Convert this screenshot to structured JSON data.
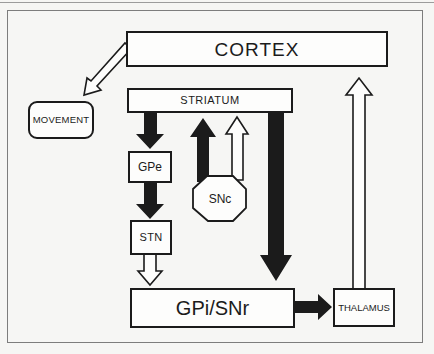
{
  "diagram": {
    "nodes": {
      "cortex": {
        "label": "CORTEX"
      },
      "movement": {
        "label": "MOVEMENT"
      },
      "striatum": {
        "label": "STRIATUM"
      },
      "gpe": {
        "label": "GPe"
      },
      "snc": {
        "label": "SNc"
      },
      "stn": {
        "label": "STN"
      },
      "gpi_snr": {
        "label": "GPi/SNr"
      },
      "thalamus": {
        "label": "THALAMUS"
      }
    },
    "connections": [
      {
        "from": "CORTEX",
        "to": "MOVEMENT",
        "style": "open"
      },
      {
        "from": "STRIATUM",
        "to": "GPe",
        "style": "filled"
      },
      {
        "from": "GPe",
        "to": "STN",
        "style": "filled"
      },
      {
        "from": "STN",
        "to": "GPi/SNr",
        "style": "open"
      },
      {
        "from": "SNc",
        "to": "STRIATUM",
        "style": "filled"
      },
      {
        "from": "SNc",
        "to": "STRIATUM",
        "style": "open"
      },
      {
        "from": "STRIATUM",
        "to": "GPi/SNr",
        "style": "filled"
      },
      {
        "from": "GPi/SNr",
        "to": "THALAMUS",
        "style": "filled"
      },
      {
        "from": "THALAMUS",
        "to": "CORTEX",
        "style": "open"
      }
    ],
    "colors": {
      "ink": "#1b1b1b",
      "paper": "#f6f6f4",
      "box_fill": "#fdfdfc"
    }
  }
}
